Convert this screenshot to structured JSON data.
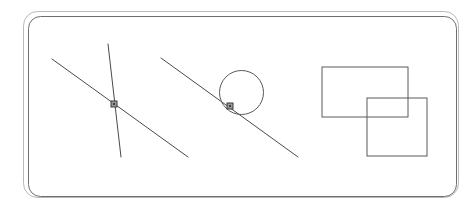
{
  "canvas": {
    "width": 474,
    "height": 208,
    "background_color": "#ffffff",
    "title": "Geometric Sketch Canvas"
  },
  "frame": {
    "name": "rounded-double-border-frame",
    "outer": {
      "x": 23.5,
      "y": 11.5,
      "width": 435,
      "height": 186,
      "rx": 14,
      "stroke": "#b9b9b9",
      "stroke_width": 1
    },
    "inner": {
      "x": 28.5,
      "y": 16.5,
      "width": 428,
      "height": 180,
      "rx": 12,
      "stroke": "#6e6e6e",
      "stroke_width": 1
    }
  },
  "stroke_colors": {
    "line": "#4a4a4a",
    "circle": "#5a5a5a",
    "rectangle": "#5a5a5a",
    "marker_stroke": "#3d3d3d",
    "marker_fill": "#9a9a9a",
    "frame_outer": "#b9b9b9",
    "frame_inner": "#6e6e6e"
  },
  "shapes": {
    "lines": [
      {
        "name": "line-a-long-diagonal",
        "x1": 52,
        "y1": 59,
        "x2": 188,
        "y2": 157,
        "stroke": "#4a4a4a",
        "stroke_width": 1
      },
      {
        "name": "line-b-steep",
        "x1": 108,
        "y1": 44,
        "x2": 121,
        "y2": 157,
        "stroke": "#4a4a4a",
        "stroke_width": 1
      },
      {
        "name": "line-c-tangent-diagonal",
        "x1": 161,
        "y1": 58,
        "x2": 298,
        "y2": 157,
        "stroke": "#4a4a4a",
        "stroke_width": 1
      }
    ],
    "circles": [
      {
        "name": "circle-main",
        "cx": 241.5,
        "cy": 92.5,
        "r": 22,
        "stroke": "#5a5a5a",
        "stroke_width": 1
      }
    ],
    "rectangles": [
      {
        "name": "rectangle-upper-left",
        "x": 322,
        "y": 67,
        "width": 86,
        "height": 50,
        "stroke": "#5a5a5a",
        "stroke_width": 1
      },
      {
        "name": "rectangle-lower-right",
        "x": 367,
        "y": 98,
        "width": 60,
        "height": 58,
        "stroke": "#5a5a5a",
        "stroke_width": 1
      }
    ],
    "markers": [
      {
        "name": "intersection-marker-left",
        "cx": 114,
        "cy": 104,
        "size": 6,
        "stroke": "#3d3d3d",
        "fill": "#9a9a9a"
      },
      {
        "name": "intersection-marker-circle",
        "cx": 230,
        "cy": 106,
        "size": 6,
        "stroke": "#3d3d3d",
        "fill": "#9a9a9a"
      }
    ]
  }
}
